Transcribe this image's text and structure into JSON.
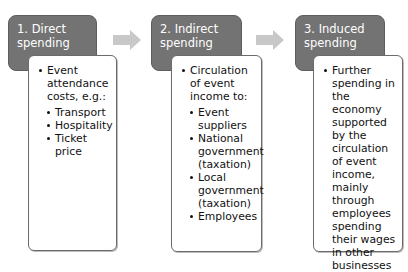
{
  "diagram": {
    "stages": [
      {
        "heading": "1. Direct spending",
        "heading_lines": [
          "1. Direct",
          "spending"
        ],
        "main_point": "Event attendance costs, e.g.:",
        "sub_points": [
          "Transport",
          "Hospitality",
          "Ticket price"
        ]
      },
      {
        "heading": "2. Indirect spending",
        "heading_lines": [
          "2. Indirect",
          "spending"
        ],
        "main_point": "Circulation of event income to:",
        "sub_points": [
          "Event suppliers",
          "National government (taxation)",
          "Local government (taxation)",
          "Employees"
        ]
      },
      {
        "heading": "3. Induced spending",
        "heading_lines": [
          "3. Induced",
          "spending"
        ],
        "main_point": "Further spending in the economy supported by the circulation of event income, mainly through employees spending their wages in other businesses",
        "sub_points": []
      }
    ],
    "arrows": [
      "arrow-1-to-2",
      "arrow-2-to-3"
    ],
    "colors": {
      "heading_fill": "#737373",
      "heading_text": "#ffffff",
      "body_fill": "#ffffff",
      "body_border": "#6b6b6b",
      "arrow_fill": "#c8c8c8"
    }
  }
}
